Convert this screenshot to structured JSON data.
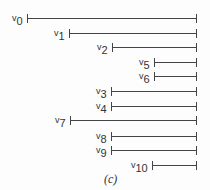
{
  "diagram": {
    "caption": "(c)",
    "right_edge_x": 196,
    "intervals": [
      {
        "name": "v0",
        "sym": "v",
        "sub": "0",
        "start_x": 27,
        "y": 18
      },
      {
        "name": "v1",
        "sym": "v",
        "sub": "1",
        "start_x": 69,
        "y": 33
      },
      {
        "name": "v2",
        "sym": "v",
        "sub": "2",
        "start_x": 112,
        "y": 47
      },
      {
        "name": "v5",
        "sym": "v",
        "sub": "5",
        "start_x": 154,
        "y": 62
      },
      {
        "name": "v6",
        "sym": "v",
        "sub": "6",
        "start_x": 154,
        "y": 76
      },
      {
        "name": "v3",
        "sym": "v",
        "sub": "3",
        "start_x": 111,
        "y": 91
      },
      {
        "name": "v4",
        "sym": "v",
        "sub": "4",
        "start_x": 111,
        "y": 106
      },
      {
        "name": "v7",
        "sym": "v",
        "sub": "7",
        "start_x": 70,
        "y": 120
      },
      {
        "name": "v8",
        "sym": "v",
        "sub": "8",
        "start_x": 111,
        "y": 136
      },
      {
        "name": "v9",
        "sym": "v",
        "sub": "9",
        "start_x": 111,
        "y": 150
      },
      {
        "name": "v10",
        "sym": "v",
        "sub": "10",
        "start_x": 152,
        "y": 165
      }
    ]
  }
}
